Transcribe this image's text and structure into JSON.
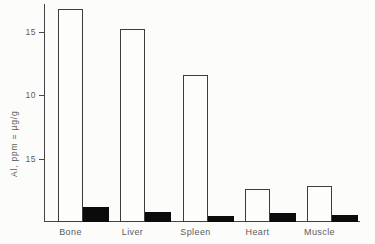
{
  "figure": {
    "background": "#fcfcfa",
    "line_color": "#454545",
    "text_color": "#5c5c5c",
    "open_bar_fill": "#fdfdfb",
    "filled_bar_fill": "#0b0b0b"
  },
  "chart_data": {
    "type": "bar",
    "title": "",
    "xlabel": "",
    "ylabel": "Al, ppm = µg/g",
    "categories": [
      "Bone",
      "Liver",
      "Spleen",
      "Heart",
      "Muscle"
    ],
    "series": [
      {
        "name": "open-bar",
        "style": "white-outlined",
        "values": [
          16.8,
          15.2,
          11.6,
          2.6,
          2.8
        ]
      },
      {
        "name": "filled-bar",
        "style": "solid-black",
        "values": [
          1.2,
          0.8,
          0.5,
          0.7,
          0.55
        ]
      }
    ],
    "yticks": [
      {
        "position": 15,
        "label": "15"
      },
      {
        "position": 10,
        "label": "10"
      },
      {
        "position": 5,
        "label": "15"
      }
    ],
    "ylim": [
      0,
      17.2
    ],
    "grid": false,
    "legend": "none"
  }
}
